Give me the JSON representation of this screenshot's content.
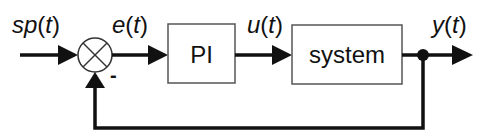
{
  "diagram": {
    "type": "feedback-control-loop",
    "signals": {
      "setpoint": {
        "name": "sp",
        "open": "(",
        "var": "t",
        "close": ")"
      },
      "error": {
        "name": "e",
        "open": "(",
        "var": "t",
        "close": ")"
      },
      "control": {
        "name": "u",
        "open": "(",
        "var": "t",
        "close": ")"
      },
      "output": {
        "name": "y",
        "open": "(",
        "var": "t",
        "close": ")"
      }
    },
    "blocks": {
      "controller": {
        "label": "PI"
      },
      "plant": {
        "label": "system"
      }
    },
    "summing_junction": {
      "feedback_sign": "-"
    },
    "colors": {
      "line": "#111111",
      "box_border": "#555555",
      "background": "#ffffff"
    }
  }
}
